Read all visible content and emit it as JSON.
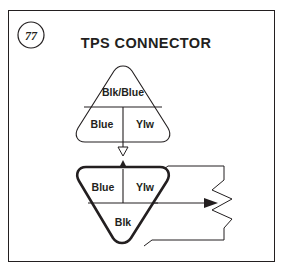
{
  "figure": {
    "number": "77",
    "title": "TPS CONNECTOR",
    "frame_color": "#231f20",
    "background_color": "#ffffff"
  },
  "connectors": [
    {
      "id": "harness-connector",
      "role": "upper",
      "orientation": "apex-up",
      "outline_weight": "thin",
      "pins": [
        {
          "position": "top",
          "label": "Blk/Blue"
        },
        {
          "position": "bottom-left",
          "label": "Blue"
        },
        {
          "position": "bottom-right",
          "label": "Ylw"
        }
      ]
    },
    {
      "id": "tps-connector",
      "role": "lower",
      "orientation": "apex-down",
      "outline_weight": "bold",
      "pins": [
        {
          "position": "top-left",
          "label": "Blue"
        },
        {
          "position": "top-right",
          "label": "Ylw"
        },
        {
          "position": "bottom",
          "label": "Blk"
        }
      ]
    }
  ],
  "annotations": {
    "mating_arrow_down": "hollow-down-arrow",
    "mating_arrow_up": "solid-up-arrow",
    "lead_arrow": "solid-right-arrow",
    "break_symbol": "zigzag-break-line"
  },
  "icons": {
    "figure_badge": "circle-badge-icon",
    "down_arrow": "arrow-down-icon",
    "up_arrow": "arrow-up-icon",
    "right_arrow": "arrow-right-icon"
  }
}
